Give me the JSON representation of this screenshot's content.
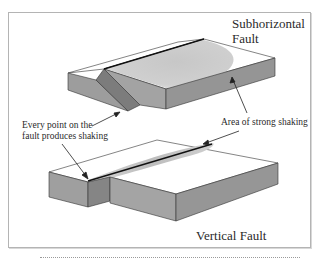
{
  "figure": {
    "labels": {
      "subhorizontal_title": [
        "Subhorizontal",
        "Fault"
      ],
      "vertical_title": "Vertical Fault",
      "every_point_note": [
        "Every point on the",
        "fault produces shaking"
      ],
      "strong_shaking_note": "Area of strong shaking"
    },
    "colors": {
      "block_top": "#ffffff",
      "block_side": "#9a9a9a",
      "block_front": "#8c8c8c",
      "fault_plane": "#7a7a7a",
      "shaking_area": "#c8c8c8",
      "fault_line": "#111111",
      "frame": "#b4b4b4"
    },
    "panels": [
      {
        "name": "subhorizontal-fault",
        "description": "Block diagram with shallow-dipping fault; broad elliptical area of strong shaking on block surface"
      },
      {
        "name": "vertical-fault",
        "description": "Block diagram with vertical fault offset; narrow elongated area of strong shaking along fault trace"
      }
    ]
  }
}
